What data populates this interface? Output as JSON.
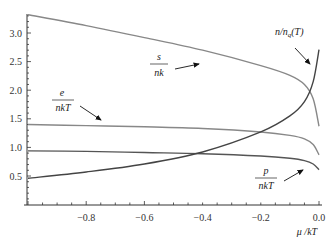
{
  "chart_data": {
    "type": "line",
    "title": "",
    "xlabel": "μ /kT",
    "ylabel": "",
    "xlim": [
      -1.0,
      0.0
    ],
    "ylim": [
      0.0,
      3.35
    ],
    "grid": false,
    "legend": "inline annotations with arrows",
    "x_ticks": [
      "-0.8",
      "-0.6",
      "-0.4",
      "-0.2",
      "0.0"
    ],
    "y_ticks": [
      "0.5",
      "1.0",
      "1.5",
      "2.0",
      "2.5",
      "3.0"
    ],
    "x": [
      -1.0,
      -0.8,
      -0.6,
      -0.4,
      -0.2,
      -0.1,
      -0.05,
      -0.02,
      0.0
    ],
    "series": [
      {
        "name": "s/nk",
        "label_num": "s",
        "label_den": "nk",
        "color": "#888888",
        "values": [
          3.32,
          3.13,
          2.92,
          2.7,
          2.43,
          2.26,
          2.1,
          1.85,
          1.37
        ]
      },
      {
        "name": "e/nkT",
        "label_num": "e",
        "label_den": "nkT",
        "color": "#888888",
        "values": [
          1.4,
          1.38,
          1.36,
          1.33,
          1.27,
          1.21,
          1.15,
          1.05,
          0.87
        ]
      },
      {
        "name": "p/nkT",
        "label_num": "p",
        "label_den": "nkT",
        "color": "#555555",
        "values": [
          0.94,
          0.93,
          0.91,
          0.89,
          0.85,
          0.81,
          0.77,
          0.71,
          0.61
        ]
      },
      {
        "name": "n/n_q(T)",
        "label": "n/n",
        "label_sub": "q",
        "label_tail": "(T)",
        "color": "#444444",
        "values": [
          0.46,
          0.57,
          0.71,
          0.92,
          1.27,
          1.55,
          1.8,
          2.15,
          2.71
        ]
      }
    ]
  }
}
